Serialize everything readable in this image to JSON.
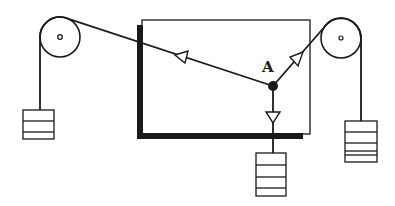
{
  "diagram": {
    "type": "force-table-pulley-system",
    "point_label": "A",
    "colors": {
      "ink": "#1a1a1a",
      "background": "#ffffff"
    },
    "components": {
      "left_pulley": {
        "cx": 60,
        "cy": 37,
        "r": 20
      },
      "right_pulley": {
        "cx": 341,
        "cy": 38,
        "r": 20
      },
      "board": {
        "x": 142,
        "y": 20,
        "width": 168,
        "height": 114
      },
      "knot_A": {
        "cx": 273,
        "cy": 86
      },
      "left_weight": {
        "x": 23,
        "y": 110,
        "width": 31,
        "height": 29,
        "slabs": 3
      },
      "center_weight": {
        "x": 256,
        "y": 153,
        "width": 30,
        "height": 43,
        "slabs": 4
      },
      "right_weight": {
        "x": 345,
        "y": 121,
        "width": 32,
        "height": 41,
        "slabs": 5
      }
    },
    "arrows": [
      {
        "name": "tension-left",
        "direction": "toward left pulley"
      },
      {
        "name": "tension-right",
        "direction": "toward right pulley"
      },
      {
        "name": "tension-down",
        "direction": "downward"
      }
    ]
  }
}
